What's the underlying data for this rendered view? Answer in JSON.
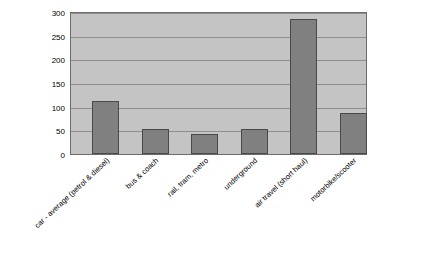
{
  "chart_data": {
    "type": "bar",
    "title": "",
    "xlabel": "",
    "ylabel": "",
    "ylim": [
      0,
      300
    ],
    "yticks": [
      0,
      50,
      100,
      150,
      200,
      250,
      300
    ],
    "grid": true,
    "legend": "none",
    "categories": [
      "car - average (petrol & diesel)",
      "bus & coach",
      "rail, tram, metro",
      "underground",
      "air travel (short haul)",
      "motorbike/scooter"
    ],
    "values": [
      112,
      54,
      43,
      53,
      288,
      88
    ],
    "colors": {
      "bar_fill": "#808080",
      "bar_stroke": "#4a4a4a",
      "plot_background": "#c4c4c4",
      "gridline": "#8f8f8f",
      "axis": "#6b6b6b",
      "text": "#000000"
    }
  }
}
